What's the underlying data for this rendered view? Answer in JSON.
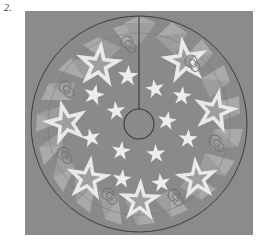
{
  "figure": {
    "label": "2.",
    "caption": "",
    "panel": {
      "background_color": "#8b8b8b",
      "page_background_color": "#ffffff",
      "x": 25,
      "y": 11,
      "width": 228,
      "height": 224
    }
  },
  "artwork": {
    "subject": "circular-tree-skirt",
    "palette": {
      "field_gray": "#8b8b8b",
      "disc_gray": "#8a8a8a",
      "triangle_light": "#a9a9a9",
      "triangle_mid": "#9d9d9d",
      "star_outline_white": "#e9e9e9",
      "star_inner_gray": "#9e9e9e",
      "small_star_white": "#ededed",
      "spiral_gray": "#6f6f6f",
      "line_dark": "#3c3c3c"
    },
    "disc": {
      "center_x": 114,
      "center_y": 113,
      "radius": 108,
      "inner_ring_radius": 91,
      "outline_color": "#3c3c3c"
    },
    "center_hole": {
      "center_x": 114,
      "center_y": 113,
      "radius": 15,
      "outline_color": "#3c3c3c"
    },
    "slit": {
      "from_y": 5,
      "to_y": 98,
      "x": 114,
      "color": "#3c3c3c"
    },
    "border_triangles": {
      "count": 40,
      "note": "alternating light triangles pointing inward and outward around rim"
    },
    "large_stars": [
      {
        "cx": 74,
        "cy": 54,
        "r": 25,
        "rot": 6
      },
      {
        "cx": 160,
        "cy": 50,
        "r": 25,
        "rot": -8
      },
      {
        "cx": 41,
        "cy": 112,
        "r": 24,
        "rot": -14
      },
      {
        "cx": 190,
        "cy": 100,
        "r": 24,
        "rot": 12
      },
      {
        "cx": 63,
        "cy": 168,
        "r": 24,
        "rot": 8
      },
      {
        "cx": 172,
        "cy": 168,
        "r": 23,
        "rot": -6
      },
      {
        "cx": 115,
        "cy": 190,
        "r": 23,
        "rot": 2
      }
    ],
    "small_stars": [
      {
        "cx": 103,
        "cy": 65,
        "r": 11,
        "rot": 4
      },
      {
        "cx": 130,
        "cy": 78,
        "r": 10,
        "rot": -10
      },
      {
        "cx": 69,
        "cy": 84,
        "r": 11,
        "rot": 14
      },
      {
        "cx": 157,
        "cy": 85,
        "r": 10,
        "rot": 6
      },
      {
        "cx": 91,
        "cy": 100,
        "r": 10,
        "rot": -6
      },
      {
        "cx": 142,
        "cy": 110,
        "r": 10,
        "rot": 10
      },
      {
        "cx": 66,
        "cy": 127,
        "r": 10,
        "rot": -12
      },
      {
        "cx": 163,
        "cy": 128,
        "r": 10,
        "rot": 4
      },
      {
        "cx": 96,
        "cy": 140,
        "r": 10,
        "rot": 8
      },
      {
        "cx": 131,
        "cy": 143,
        "r": 10,
        "rot": -4
      },
      {
        "cx": 97,
        "cy": 168,
        "r": 10,
        "rot": 6
      },
      {
        "cx": 136,
        "cy": 172,
        "r": 10,
        "rot": -8
      },
      {
        "cx": 187,
        "cy": 146,
        "r": 0,
        "rot": 0
      }
    ],
    "spirals": [
      {
        "cx": 105,
        "cy": 34
      },
      {
        "cx": 169,
        "cy": 53
      },
      {
        "cx": 43,
        "cy": 79
      },
      {
        "cx": 193,
        "cy": 133
      },
      {
        "cx": 41,
        "cy": 145
      },
      {
        "cx": 86,
        "cy": 186
      },
      {
        "cx": 152,
        "cy": 187
      }
    ]
  }
}
